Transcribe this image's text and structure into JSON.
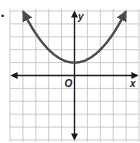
{
  "chart_data": {
    "type": "line",
    "title": "",
    "xlabel": "x",
    "ylabel": "y",
    "origin_label": "O",
    "function": "y = 0.25x^2 + 1",
    "vertex": [
      0,
      1
    ],
    "grid": true,
    "xlim": [
      -5,
      5
    ],
    "ylim": [
      -5,
      5
    ],
    "arrows": {
      "curve_ends": true,
      "axes": true
    },
    "series": [
      {
        "name": "parabola",
        "x": [
          -4,
          -3,
          -2,
          -1,
          0,
          1,
          2,
          3,
          4
        ],
        "values": [
          5,
          3.25,
          2,
          1.25,
          1,
          1.25,
          2,
          3.25,
          5
        ]
      }
    ]
  },
  "colors": {
    "grid": "#bdbdbd",
    "axis": "#1a1a1a",
    "curve": "#4a4a4a"
  },
  "decoration": {
    "bullet": "•"
  }
}
